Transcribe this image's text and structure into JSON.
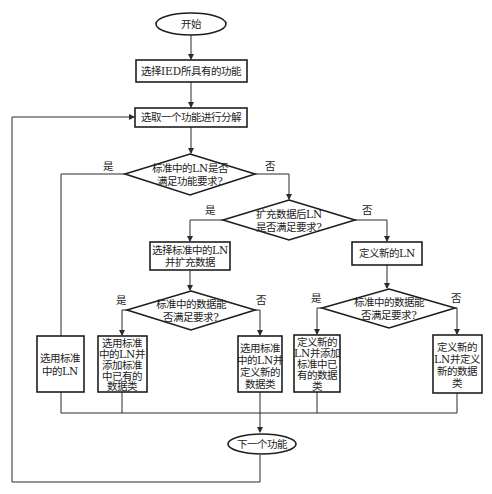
{
  "flowchart": {
    "start": "开始",
    "step_select_functions": "选择IED所具有的功能",
    "step_pick_function": "选取一个功能进行分解",
    "decision_ln_meets": [
      "标准中的LN是否",
      "满足功能要求?"
    ],
    "decision_extend_meets": [
      "扩充数据后LN",
      "是否满足要求?"
    ],
    "step_select_and_extend": [
      "选择标准中的LN",
      "并扩充数据"
    ],
    "step_define_new_ln": "定义新的LN",
    "decision_data_left": [
      "标准中的数据能",
      "否满足要求?"
    ],
    "decision_data_right": [
      "标准中的数据能",
      "否满足要求?"
    ],
    "box_use_standard_ln": [
      "选用标准",
      "中的LN"
    ],
    "box_use_ln_add_existing": [
      "选用标准",
      "中的LN并",
      "添加标准",
      "中已有的",
      "数据类"
    ],
    "box_use_ln_define_new": [
      "选用标准",
      "中的LN并",
      "定义新的",
      "数据类"
    ],
    "box_new_ln_add_existing": [
      "定义新的",
      "LN并添加",
      "标准中已",
      "有的数据",
      "类"
    ],
    "box_new_ln_define_new": [
      "定义新的",
      "LN并定义",
      "新的数据",
      "类"
    ],
    "end": "下一个功能",
    "labels": {
      "yes": "是",
      "no": "否"
    }
  }
}
